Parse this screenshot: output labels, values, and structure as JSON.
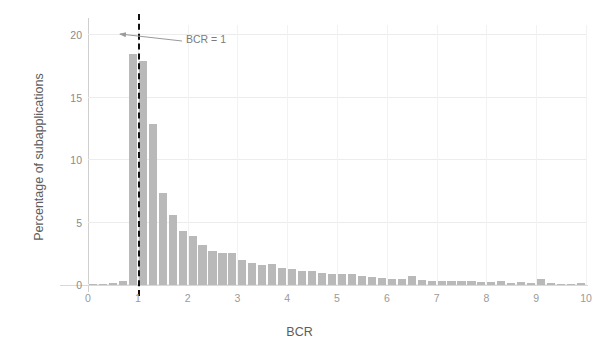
{
  "chart_data": {
    "type": "bar",
    "title": "",
    "subtitle": "",
    "xlabel": "BCR",
    "ylabel": "Percentage of subapplications",
    "xlim": [
      0,
      10
    ],
    "ylim": [
      0,
      20.8
    ],
    "xticks": [
      "0",
      "1",
      "2",
      "3",
      "4",
      "5",
      "6",
      "7",
      "8",
      "9",
      "10"
    ],
    "xtick_values": [
      0,
      1,
      2,
      3,
      4,
      5,
      6,
      7,
      8,
      9,
      10
    ],
    "yticks": [
      "0",
      "5",
      "10",
      "15",
      "20"
    ],
    "ytick_values": [
      0,
      5,
      10,
      15,
      20
    ],
    "grid": true,
    "legend": "none",
    "bin_width": 0.2,
    "bar_color": "#b9b9b9",
    "x": [
      0.1,
      0.3,
      0.5,
      0.7,
      0.9,
      1.1,
      1.3,
      1.5,
      1.7,
      1.9,
      2.1,
      2.3,
      2.5,
      2.7,
      2.9,
      3.1,
      3.3,
      3.5,
      3.7,
      3.9,
      4.1,
      4.3,
      4.5,
      4.7,
      4.9,
      5.1,
      5.3,
      5.5,
      5.7,
      5.9,
      6.1,
      6.3,
      6.5,
      6.7,
      6.9,
      7.1,
      7.3,
      7.5,
      7.7,
      7.9,
      8.1,
      8.3,
      8.5,
      8.7,
      8.9,
      9.1,
      9.3,
      9.5,
      9.7,
      9.9
    ],
    "values": [
      0.05,
      0.1,
      0.15,
      0.35,
      18.5,
      17.9,
      12.9,
      7.4,
      5.6,
      4.3,
      3.9,
      3.2,
      2.7,
      2.6,
      2.55,
      2.0,
      1.75,
      1.6,
      1.7,
      1.35,
      1.25,
      1.15,
      1.1,
      0.95,
      0.9,
      0.85,
      0.85,
      0.75,
      0.65,
      0.6,
      0.5,
      0.45,
      0.75,
      0.4,
      0.35,
      0.35,
      0.3,
      0.35,
      0.3,
      0.25,
      0.25,
      0.3,
      0.2,
      0.25,
      0.2,
      0.45,
      0.2,
      0.1,
      0.1,
      0.15
    ],
    "annotations": [
      {
        "text": "BCR = 1",
        "target_x": 1,
        "type": "arrow-annotation",
        "line_style": "dashed",
        "line_color": "#111111"
      }
    ]
  },
  "axes": {
    "x_axis_label": "BCR",
    "y_axis_label": "Percentage of subapplications"
  },
  "annotation": {
    "label": "BCR = 1"
  }
}
